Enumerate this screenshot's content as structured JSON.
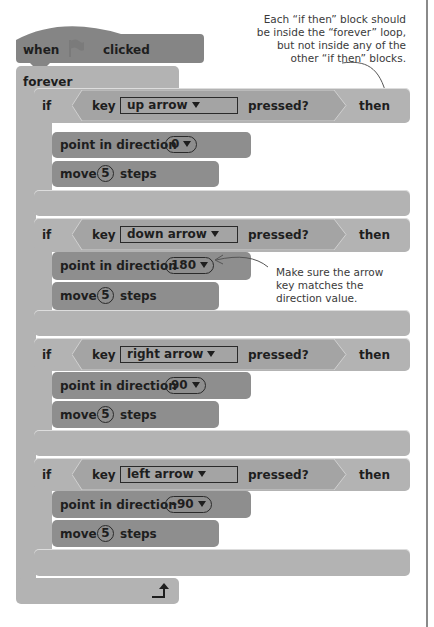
{
  "hat_block": {
    "when": "when",
    "flag_icon": "green-flag",
    "clicked": "clicked"
  },
  "forever_block": {
    "label": "forever",
    "loop_arrow_icon": "loop-arrow"
  },
  "if_blocks": [
    {
      "if": "if",
      "key": "key",
      "key_option": "up arrow",
      "pressed": "pressed?",
      "then": "then",
      "point_label": "point in direction",
      "direction": "0",
      "move_label": "move",
      "steps_value": "5",
      "steps_label": "steps"
    },
    {
      "if": "if",
      "key": "key",
      "key_option": "down arrow",
      "pressed": "pressed?",
      "then": "then",
      "point_label": "point in direction",
      "direction": "180",
      "move_label": "move",
      "steps_value": "5",
      "steps_label": "steps"
    },
    {
      "if": "if",
      "key": "key",
      "key_option": "right arrow",
      "pressed": "pressed?",
      "then": "then",
      "point_label": "point in direction",
      "direction": "90",
      "move_label": "move",
      "steps_value": "5",
      "steps_label": "steps"
    },
    {
      "if": "if",
      "key": "key",
      "key_option": "left arrow",
      "pressed": "pressed?",
      "then": "then",
      "point_label": "point in direction",
      "direction": "–90",
      "move_label": "move",
      "steps_value": "5",
      "steps_label": "steps"
    }
  ],
  "annotations": {
    "top": [
      "Each “if then” block should",
      "be inside the “forever” loop,",
      "but not inside any of the",
      "other “if then” blocks."
    ],
    "direction": [
      "Make sure the arrow",
      "key matches the",
      "direction value."
    ]
  },
  "colors": {
    "events": "#858585",
    "control": "#b3b3b3",
    "motion": "#8e8e8e",
    "sensing": "#a4a4a4",
    "border_line": "#8a8a8a"
  }
}
